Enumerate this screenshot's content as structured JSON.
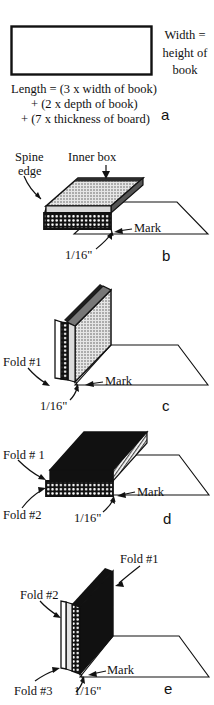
{
  "figure": {
    "ink_color": "#111111",
    "paper_color": "#ffffff",
    "fill_dark": "#111111",
    "fill_mid_gray": "#8a8a8a",
    "fill_light": "#e8e8e8"
  },
  "panel_a": {
    "letter": "a",
    "right_label_line1": "Width =",
    "right_label_line2": "height of",
    "right_label_line3": "book",
    "formula_line1": "Length = (3 x width of book)",
    "formula_line2": "+ (2 x depth of book)",
    "formula_line3": "+ (7 x thickness of board)"
  },
  "panel_b": {
    "letter": "b",
    "spine_edge_line1": "Spine",
    "spine_edge_line2": "edge",
    "inner_box": "Inner box",
    "mark": "Mark",
    "measure": "1/16\""
  },
  "panel_c": {
    "letter": "c",
    "fold1": "Fold #1",
    "mark": "Mark",
    "measure": "1/16\""
  },
  "panel_d": {
    "letter": "d",
    "fold1": "Fold # 1",
    "fold2": "Fold #2",
    "mark": "Mark",
    "measure": "1/16\""
  },
  "panel_e": {
    "letter": "e",
    "fold1": "Fold #1",
    "fold2": "Fold #2",
    "fold3": "Fold #3",
    "mark": "Mark",
    "measure": "1/16\""
  }
}
